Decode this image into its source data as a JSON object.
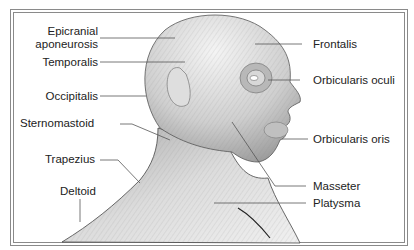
{
  "diagram": {
    "labels_left": [
      {
        "id": "epicranial",
        "line1": "Epicranial",
        "line2": "aponeurosis"
      },
      {
        "id": "temporalis",
        "text": "Temporalis"
      },
      {
        "id": "occipitalis",
        "text": "Occipitalis"
      },
      {
        "id": "sternomastoid",
        "text": "Sternomastoid"
      },
      {
        "id": "trapezius",
        "text": "Trapezius"
      },
      {
        "id": "deltoid",
        "text": "Deltoid"
      }
    ],
    "labels_right": [
      {
        "id": "frontalis",
        "text": "Frontalis"
      },
      {
        "id": "orbicularis_oculi",
        "text": "Orbicularis oculi"
      },
      {
        "id": "orbicularis_oris",
        "text": "Orbicularis oris"
      },
      {
        "id": "masseter",
        "text": "Masseter"
      },
      {
        "id": "platysma",
        "text": "Platysma"
      }
    ],
    "colors": {
      "frame": "#8a8a8a",
      "text": "#222222",
      "skin_light": "#eeeeee",
      "skin_mid": "#c8c8c8",
      "skin_dark": "#9a9a9a",
      "leader": "#555555"
    }
  }
}
